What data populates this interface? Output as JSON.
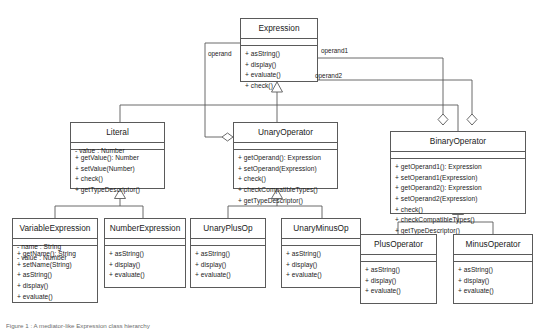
{
  "diagram": {
    "type": "uml-class-diagram",
    "title": "Expression class hierarchy",
    "caption": "Figure 1 : A mediator-like Expression class hierarchy",
    "classes": [
      {
        "id": "expression",
        "name": "Expression",
        "attributes": [],
        "operations": [
          "+ asString()",
          "+ display()",
          "+ evaluate()",
          "+ check()"
        ]
      },
      {
        "id": "literal",
        "name": "Literal",
        "attributes": [
          "- value : Number"
        ],
        "operations": [
          "+ getValue(): Number",
          "+ setValue(Number)",
          "+ check()",
          "+ getTypeDescriptor()"
        ]
      },
      {
        "id": "unary-operator",
        "name": "UnaryOperator",
        "attributes": [],
        "operations": [
          "+ getOperand(): Expression",
          "+ setOperand(Expression)",
          "+ check()",
          "+ checkCompatibleTypes()",
          "+ getTypeDescriptor()"
        ]
      },
      {
        "id": "binary-operator",
        "name": "BinaryOperator",
        "attributes": [],
        "operations": [
          "+ getOperand1(): Expression",
          "+ setOperand1(Expression)",
          "+ getOperand2(): Expression",
          "+ setOperand2(Expression)",
          "+ check()",
          "+ checkCompatibleTypes()",
          "+ getTypeDescriptor()"
        ]
      },
      {
        "id": "variable-expression",
        "name": "VariableExpression",
        "attributes": [
          "- name : String",
          "- value : Number"
        ],
        "operations": [
          "+ getName(): String",
          "+ setName(String)",
          "+ asString()",
          "+ display()",
          "+ evaluate()"
        ]
      },
      {
        "id": "number-expression",
        "name": "NumberExpression",
        "attributes": [],
        "operations": [
          "+ asString()",
          "+ display()",
          "+ evaluate()"
        ]
      },
      {
        "id": "unary-plus-op",
        "name": "UnaryPlusOp",
        "attributes": [],
        "operations": [
          "+ asString()",
          "+ display()",
          "+ evaluate()"
        ]
      },
      {
        "id": "unary-minus-op",
        "name": "UnaryMinusOp",
        "attributes": [],
        "operations": [
          "+ asString()",
          "+ display()",
          "+ evaluate()"
        ]
      },
      {
        "id": "plus-operator",
        "name": "PlusOperator",
        "attributes": [],
        "operations": [
          "+ asString()",
          "+ display()",
          "+ evaluate()"
        ]
      },
      {
        "id": "minus-operator",
        "name": "MinusOperator",
        "attributes": [],
        "operations": [
          "+ asString()",
          "+ display()",
          "+ evaluate()"
        ]
      }
    ],
    "association_labels": {
      "operand": "operand",
      "operand1": "operand1",
      "operand2": "operand2"
    },
    "colors": {
      "stroke": "#5a5a5a",
      "fill": "#ffffff",
      "text": "#1a1a1a",
      "caption": "#6d6d6d"
    }
  }
}
